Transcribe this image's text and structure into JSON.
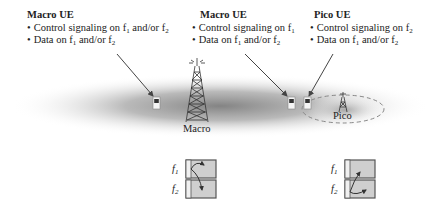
{
  "labels": {
    "macro_ue_left": {
      "title": "Macro UE",
      "bullets": [
        {
          "text": "Control signaling on f",
          "parts": [
            {
              "t": "Control signaling on f"
            },
            {
              "sub": "1"
            },
            {
              "t": " and/or f"
            },
            {
              "sub": "2"
            }
          ]
        },
        {
          "text": "Data on f1 and/or f2",
          "parts": [
            {
              "t": "Data on f"
            },
            {
              "sub": "1"
            },
            {
              "t": " and/or f"
            },
            {
              "sub": "2"
            }
          ]
        }
      ]
    },
    "macro_ue_center": {
      "title": "Macro UE",
      "bullets": [
        {
          "parts": [
            {
              "t": "Control signaling on f"
            },
            {
              "sub": "1"
            }
          ]
        },
        {
          "parts": [
            {
              "t": "Data on f"
            },
            {
              "sub": "1"
            },
            {
              "t": " and/or f"
            },
            {
              "sub": "2"
            }
          ]
        }
      ]
    },
    "pico_ue": {
      "title": "Pico UE",
      "bullets": [
        {
          "parts": [
            {
              "t": "Control signaling on f"
            },
            {
              "sub": "2"
            }
          ]
        },
        {
          "parts": [
            {
              "t": "Data on f"
            },
            {
              "sub": "1"
            },
            {
              "t": " and/or f"
            },
            {
              "sub": "2"
            }
          ]
        }
      ]
    }
  },
  "towers": {
    "macro": {
      "label": "Macro"
    },
    "pico": {
      "label": "Pico"
    }
  },
  "carrier_diagrams": {
    "macro": {
      "f1": "f",
      "f1_sub": "1",
      "f2": "f",
      "f2_sub": "2"
    },
    "pico": {
      "f1": "f",
      "f1_sub": "1",
      "f2": "f",
      "f2_sub": "2"
    }
  },
  "colors": {
    "coverage_dark": "#8a8a8a",
    "arrow": "#444444",
    "carrier_fill": "#cfcfcf",
    "carrier_border": "#555555",
    "pico_ellipse": "#888888"
  }
}
